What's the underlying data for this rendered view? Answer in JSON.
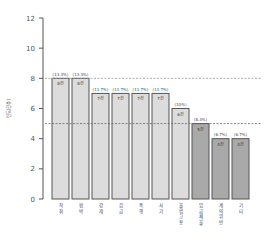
{
  "chart_data": {
    "type": "bar",
    "title": "",
    "xlabel": "",
    "ylabel": "빈도(건수)",
    "ylim": [
      0,
      12
    ],
    "yticks": [
      0,
      2,
      4,
      6,
      8,
      10,
      12
    ],
    "grid": false,
    "legend": null,
    "categories": [
      "착취",
      "협박",
      "강제",
      "감금",
      "폭행",
      "사기",
      "불법고용",
      "임금체불",
      "계약위반",
      "기타"
    ],
    "values": [
      8,
      8,
      7,
      7,
      7,
      7,
      6,
      5,
      4,
      4
    ],
    "percent_labels": [
      "(13.3%)",
      "(13.3%)",
      "(11.7%)",
      "(11.7%)",
      "(11.7%)",
      "(11.7%)",
      "(10%)",
      "(8.3%)",
      "(6.7%)",
      "(6.7%)"
    ],
    "count_labels": [
      "8건",
      "8건",
      "7건",
      "7건",
      "7건",
      "7건",
      "6건",
      "5건",
      "4건",
      "4건"
    ],
    "bar_colors": [
      "#dcdcdc",
      "#dcdcdc",
      "#dcdcdc",
      "#dcdcdc",
      "#dcdcdc",
      "#dcdcdc",
      "#dcdcdc",
      "#a9a9a9",
      "#a9a9a9",
      "#a9a9a9"
    ],
    "reference_lines": [
      {
        "y": 8,
        "style": "dashed",
        "color": "#999999"
      },
      {
        "y": 5,
        "style": "dashed",
        "color": "#666666"
      }
    ],
    "note": "Category labels are small Korean text rendered vertically; transcriptions are best-effort."
  },
  "colors": {
    "light_bar": "#dcdcdc",
    "dark_bar": "#a9a9a9",
    "bar_border": "#555555",
    "axis": "#555555"
  }
}
